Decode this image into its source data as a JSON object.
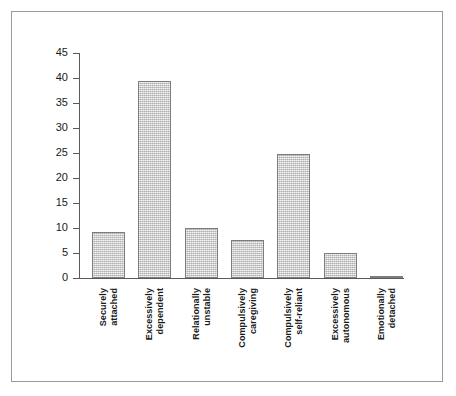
{
  "figure": {
    "background": "#ffffff",
    "border_color": "#9a9a9a",
    "axis_color": "#5a5a5a",
    "bar_fill": "#c9c9c9",
    "bar_border": "#7d7d7d"
  },
  "chart_data": {
    "type": "bar",
    "title": "",
    "subtitle": "",
    "xlabel": "",
    "ylabel": "",
    "ylim": [
      0,
      45
    ],
    "yticks": [
      0,
      5,
      10,
      15,
      20,
      25,
      30,
      35,
      40,
      45
    ],
    "ytick_labels": [
      "0",
      "5",
      "10",
      "15",
      "20",
      "25",
      "30",
      "35",
      "40",
      "45"
    ],
    "grid": false,
    "legend": null,
    "categories": [
      "Securely attached",
      "Excessively dependent",
      "Relationally unstable",
      "Compulsively caregiving",
      "Compulsively self-reliant",
      "Excessively autonomous",
      "Emotionally detached"
    ],
    "category_lines": [
      [
        "Securely",
        "attached"
      ],
      [
        "Excessively",
        "dependent"
      ],
      [
        "Relationally",
        "unstable"
      ],
      [
        "Compulsively",
        "caregiving"
      ],
      [
        "Compulsively",
        "self-reliant"
      ],
      [
        "Excessively",
        "autonomous"
      ],
      [
        "Emotionally",
        "detached"
      ]
    ],
    "values": [
      9.3,
      39.4,
      10.0,
      7.7,
      24.8,
      5.1,
      0.3
    ]
  }
}
